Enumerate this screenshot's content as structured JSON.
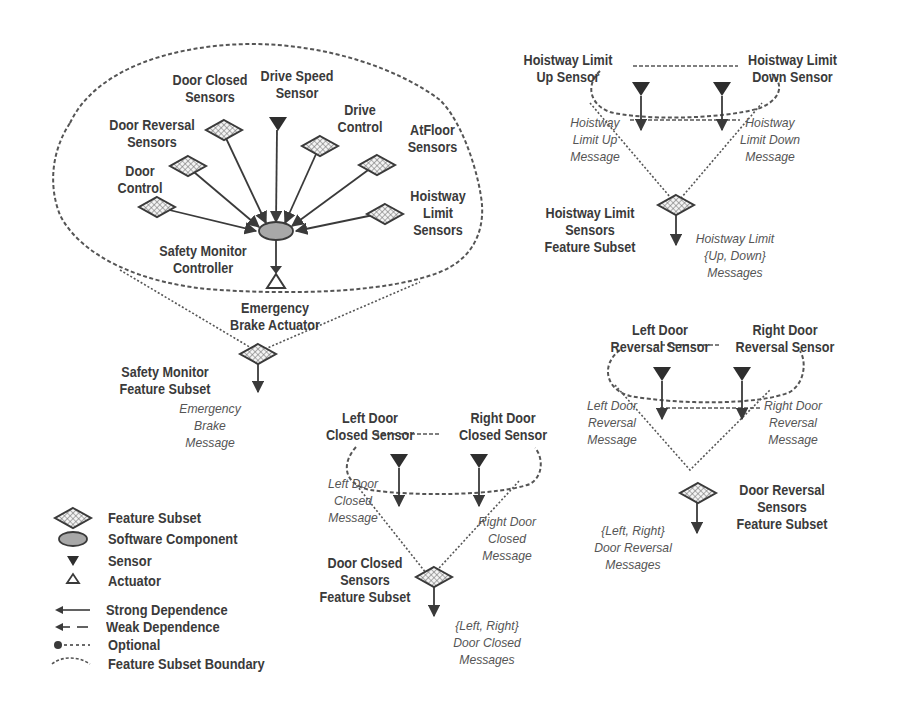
{
  "safety_monitor": {
    "inputs": [
      {
        "id": "door_control",
        "label": [
          "Door",
          "Control"
        ],
        "type": "feature-subset"
      },
      {
        "id": "door_reversal_sensors",
        "label": [
          "Door Reversal",
          "Sensors"
        ],
        "type": "feature-subset"
      },
      {
        "id": "door_closed_sensors",
        "label": [
          "Door Closed",
          "Sensors"
        ],
        "type": "feature-subset"
      },
      {
        "id": "drive_speed_sensor",
        "label": [
          "Drive Speed",
          "Sensor"
        ],
        "type": "sensor"
      },
      {
        "id": "drive_control",
        "label": [
          "Drive",
          "Control"
        ],
        "type": "feature-subset"
      },
      {
        "id": "atfloor_sensors",
        "label": [
          "AtFloor",
          "Sensors"
        ],
        "type": "feature-subset"
      },
      {
        "id": "hoistway_limit_sensors",
        "label": [
          "Hoistway",
          "Limit",
          "Sensors"
        ],
        "type": "feature-subset"
      }
    ],
    "controller": {
      "label": [
        "Safety Monitor",
        "Controller"
      ],
      "type": "software-component"
    },
    "actuator": {
      "label": [
        "Emergency",
        "Brake Actuator"
      ],
      "type": "actuator"
    },
    "subset": {
      "label": [
        "Safety Monitor",
        "Feature Subset"
      ]
    },
    "output_message": [
      "Emergency",
      "Brake",
      "Message"
    ]
  },
  "hoistway_limit": {
    "left_sensor": [
      "Hoistway Limit",
      "Up Sensor"
    ],
    "right_sensor": [
      "Hoistway Limit",
      "Down Sensor"
    ],
    "left_message": [
      "Hoistway",
      "Limit Up",
      "Message"
    ],
    "right_message": [
      "Hoistway",
      "Limit Down",
      "Message"
    ],
    "subset": [
      "Hoistway Limit",
      "Sensors",
      "Feature Subset"
    ],
    "output_message": [
      "Hoistway Limit",
      "{Up, Down}",
      "Messages"
    ]
  },
  "door_reversal": {
    "left_sensor": [
      "Left Door",
      "Reversal Sensor"
    ],
    "right_sensor": [
      "Right Door",
      "Reversal Sensor"
    ],
    "left_message": [
      "Left Door",
      "Reversal",
      "Message"
    ],
    "right_message": [
      "Right Door",
      "Reversal",
      "Message"
    ],
    "subset": [
      "Door Reversal",
      "Sensors",
      "Feature Subset"
    ],
    "output_message": [
      "{Left, Right}",
      "Door Reversal",
      "Messages"
    ]
  },
  "door_closed": {
    "left_sensor": [
      "Left Door",
      "Closed Sensor"
    ],
    "right_sensor": [
      "Right Door",
      "Closed Sensor"
    ],
    "left_message": [
      "Left Door",
      "Closed",
      "Message"
    ],
    "right_message": [
      "Right Door",
      "Closed",
      "Message"
    ],
    "subset": [
      "Door Closed",
      "Sensors",
      "Feature Subset"
    ],
    "output_message": [
      "{Left, Right}",
      "Door Closed",
      "Messages"
    ]
  },
  "legend": {
    "items": [
      {
        "icon": "feature-subset-diamond-icon",
        "label": "Feature Subset"
      },
      {
        "icon": "software-component-ellipse-icon",
        "label": "Software Component"
      },
      {
        "icon": "sensor-triangle-down-icon",
        "label": "Sensor"
      },
      {
        "icon": "actuator-triangle-up-icon",
        "label": "Actuator"
      },
      {
        "icon": "strong-dependence-arrow-icon",
        "label": "Strong Dependence"
      },
      {
        "icon": "weak-dependence-arrow-icon",
        "label": "Weak Dependence"
      },
      {
        "icon": "optional-dependence-icon",
        "label": "Optional"
      },
      {
        "icon": "boundary-dashed-curve-icon",
        "label": "Feature Subset Boundary"
      }
    ]
  },
  "colors": {
    "ink": "#3a3a3a",
    "message_ink": "#555555",
    "boundary": "#555555",
    "ellipse_fill": "#a8a8a8",
    "background": "#ffffff"
  }
}
